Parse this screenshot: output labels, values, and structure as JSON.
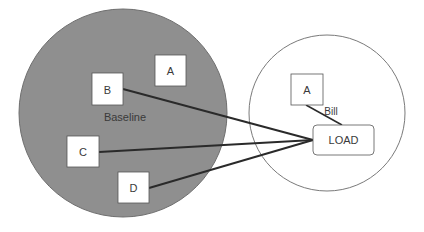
{
  "diagram": {
    "colors": {
      "baseline_fill": "#8f8f8f",
      "baseline_stroke": "#6e6e6e",
      "bill_fill": "#ffffff",
      "bill_stroke": "#7a7a7a",
      "box_fill": "#ffffff",
      "line": "#2a2a2a",
      "text": "#3a3a3a"
    },
    "regions": {
      "baseline": {
        "label": "Baseline"
      },
      "bill": {
        "label": "Bill"
      }
    },
    "nodes": {
      "baseline_b": {
        "label": "B"
      },
      "baseline_a": {
        "label": "A"
      },
      "baseline_c": {
        "label": "C"
      },
      "baseline_d": {
        "label": "D"
      },
      "bill_a": {
        "label": "A"
      },
      "load": {
        "label": "LOAD"
      }
    },
    "edges": [
      {
        "from": "B",
        "to": "LOAD"
      },
      {
        "from": "C",
        "to": "LOAD"
      },
      {
        "from": "D",
        "to": "LOAD"
      },
      {
        "from": "A (Bill)",
        "to": "LOAD"
      }
    ]
  }
}
